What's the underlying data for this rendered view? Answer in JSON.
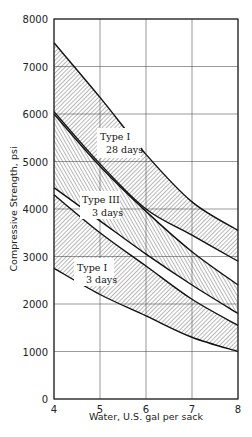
{
  "chart_data": {
    "type": "area",
    "title": "",
    "xlabel": "Water, U.S. gal per sack",
    "ylabel": "Compressive Strength, psi",
    "xlim": [
      4,
      8
    ],
    "ylim": [
      0,
      8000
    ],
    "x_ticks": [
      "4",
      "5",
      "6",
      "7",
      "8"
    ],
    "y_ticks": [
      "0",
      "1000",
      "2000",
      "3000",
      "4000",
      "5000",
      "6000",
      "7000",
      "8000"
    ],
    "grid": true,
    "x": [
      4,
      5,
      6,
      7,
      8
    ],
    "series": [
      {
        "name": "Type I 28 days",
        "label_line1": "Type I",
        "label_line2": "28 days",
        "upper": [
          7500,
          6350,
          5150,
          4150,
          3550
        ],
        "lower": [
          6050,
          4950,
          4000,
          3450,
          2900
        ],
        "hatch": "fine"
      },
      {
        "name": "Type III 3 days",
        "label_line1": "Type III",
        "label_line2": "3 days",
        "upper": [
          6000,
          4900,
          3950,
          3100,
          2400
        ],
        "lower": [
          4450,
          3750,
          3050,
          2400,
          1800
        ],
        "hatch": "steep"
      },
      {
        "name": "Type I 3 days",
        "label_line1": "Type I",
        "label_line2": "3 days",
        "upper": [
          4300,
          3500,
          2800,
          2100,
          1550
        ],
        "lower": [
          2750,
          2200,
          1750,
          1300,
          1000
        ],
        "hatch": "fine"
      }
    ],
    "legend": "inline labels on bands"
  }
}
